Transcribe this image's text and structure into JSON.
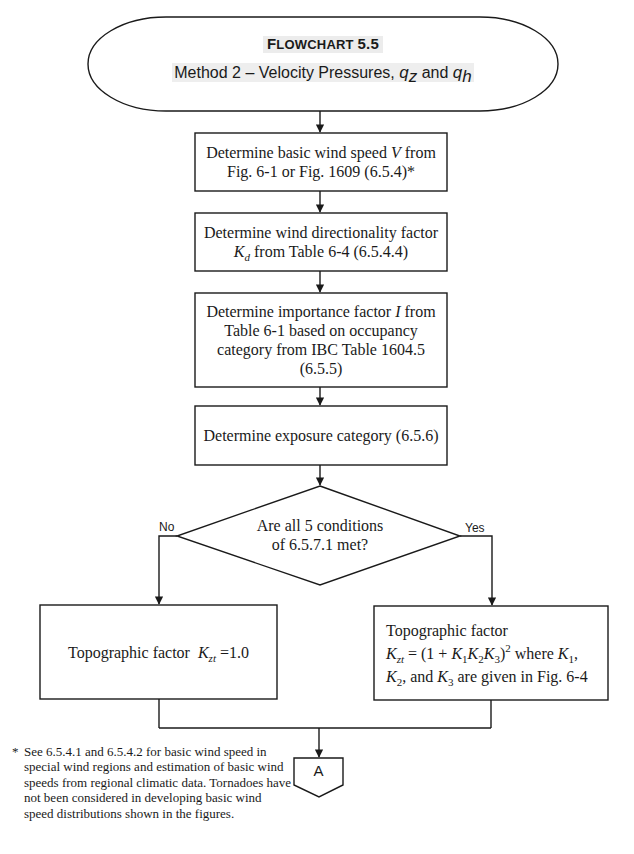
{
  "header": {
    "title": "Flowchart 5.5",
    "title_prefix_cap": "F",
    "title_rest": "LOWCHART",
    "title_number": "5.5",
    "subtitle_text": "Method 2 – Velocity Pressures,",
    "subtitle_var1": "q",
    "subtitle_var1_sub": "z",
    "subtitle_and": "and",
    "subtitle_var2": "q",
    "subtitle_var2_sub": "h"
  },
  "steps": [
    {
      "id": "basic-wind-speed",
      "line1_pre": "Determine basic wind speed",
      "line1_var": "V",
      "line1_post": "from",
      "line2": "Fig. 6-1 or Fig. 1609 (6.5.4)*"
    },
    {
      "id": "directionality-factor",
      "line1": "Determine wind directionality factor",
      "line2_var": "K",
      "line2_sub": "d",
      "line2_post": "from Table 6-4 (6.5.4.4)"
    },
    {
      "id": "importance-factor",
      "line1_pre": "Determine importance factor",
      "line1_var": "I",
      "line1_post": "from",
      "line2": "Table 6-1 based on occupancy",
      "line3": "category from IBC Table 1604.5",
      "line4": "(6.5.5)"
    },
    {
      "id": "exposure-category",
      "line1": "Determine exposure category (6.5.6)"
    }
  ],
  "decision": {
    "line1": "Are all 5 conditions",
    "line2": "of 6.5.7.1 met?",
    "no_label": "No",
    "yes_label": "Yes"
  },
  "outcomes": {
    "no": {
      "text_pre": "Topographic factor",
      "var": "K",
      "var_sub": "zt",
      "text_post": "=1.0"
    },
    "yes": {
      "line1": "Topographic factor",
      "eq_var": "K",
      "eq_sub": "zt",
      "eq_mid": "= (1 +",
      "k1": "K",
      "k1_sub": "1",
      "k2": "K",
      "k2_sub": "2",
      "k3": "K",
      "k3_sub": "3",
      "eq_close": ")",
      "eq_exp": "2",
      "where": "where",
      "w_k1": "K",
      "w_k1_sub": "1",
      "w_comma": ",",
      "l3_k2": "K",
      "l3_k2_sub": "2",
      "l3_and": ", and",
      "l3_k3": "K",
      "l3_k3_sub": "3",
      "l3_post": "are given in Fig. 6-4"
    }
  },
  "connector": {
    "label": "A"
  },
  "footnote": {
    "marker": "*",
    "text": "See 6.5.4.1 and 6.5.4.2 for basic wind speed in special wind regions and estimation of basic wind speeds from regional climatic data. Tornadoes have not been considered in developing basic wind speed distributions shown in the figures."
  },
  "colors": {
    "line": "#1a1a1a",
    "text": "#1a1a1a",
    "title_highlight": "#ececec",
    "background": "#ffffff"
  }
}
